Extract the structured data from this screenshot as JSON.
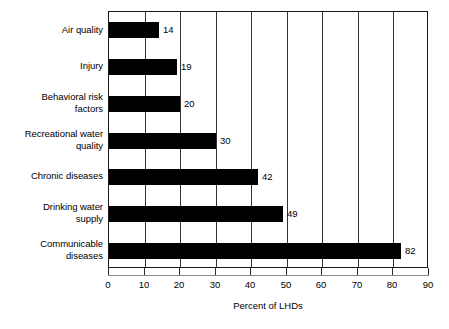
{
  "chart_data": {
    "type": "bar",
    "orientation": "horizontal",
    "title": "",
    "subtitle": "",
    "xlabel": "Percent of LHDs",
    "ylabel": "",
    "xlim": [
      0,
      90
    ],
    "xticks": [
      0,
      10,
      20,
      30,
      40,
      50,
      60,
      70,
      80,
      90
    ],
    "grid": true,
    "grid_axis": "x",
    "legend": false,
    "bar_color": "#000000",
    "axis_color": "#000000",
    "categories": [
      "Air quality",
      "Injury",
      "Behavioral risk factors",
      "Recreational water quality",
      "Chronic diseases",
      "Drinking water supply",
      "Communicable diseases"
    ],
    "category_lines": [
      [
        "Air quality"
      ],
      [
        "Injury"
      ],
      [
        "Behavioral risk",
        "factors"
      ],
      [
        "Recreational water",
        "quality"
      ],
      [
        "Chronic diseases"
      ],
      [
        "Drinking water",
        "supply"
      ],
      [
        "Communicable",
        "diseases"
      ]
    ],
    "values": [
      14,
      19,
      20,
      30,
      42,
      49,
      82
    ],
    "data_labels": [
      "14",
      "19",
      "20",
      "30",
      "42",
      "49",
      "82"
    ]
  }
}
